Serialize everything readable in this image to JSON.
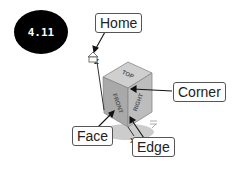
{
  "badge": {
    "text": "4.11"
  },
  "callouts": {
    "home": "Home",
    "corner": "Corner",
    "face": "Face",
    "edge": "Edge"
  },
  "cube": {
    "faces": {
      "top": "TOP",
      "front": "FRONT",
      "right": "RIGHT"
    },
    "axes": {
      "z": "Z",
      "x": "X"
    }
  },
  "colors": {
    "badge_bg": "#000000",
    "cube_top": "#c8c8c8",
    "cube_front": "#a8a8a8",
    "cube_right": "#b8b8b8"
  }
}
